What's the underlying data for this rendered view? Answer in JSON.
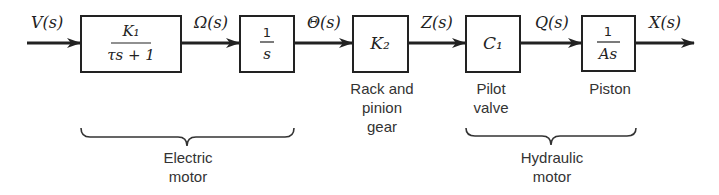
{
  "diagram": {
    "type": "block-diagram",
    "signals": [
      {
        "id": "input",
        "label": "V(s)"
      },
      {
        "id": "omega",
        "label": "Ω(s)"
      },
      {
        "id": "theta",
        "label": "Θ(s)"
      },
      {
        "id": "z",
        "label": "Z(s)"
      },
      {
        "id": "q",
        "label": "Q(s)"
      },
      {
        "id": "output",
        "label": "X(s)"
      }
    ],
    "blocks": [
      {
        "id": "motor-tf",
        "numerator": "K₁",
        "denominator": "τs + 1",
        "caption": []
      },
      {
        "id": "integrator",
        "numerator": "1",
        "denominator": "s",
        "caption": []
      },
      {
        "id": "rack-pinion",
        "gain": "K₂",
        "caption": [
          "Rack and",
          "pinion",
          "gear"
        ]
      },
      {
        "id": "pilot-valve",
        "gain": "C₁",
        "caption": [
          "Pilot",
          "valve"
        ]
      },
      {
        "id": "piston",
        "numerator": "1",
        "denominator": "As",
        "caption": [
          "Piston"
        ]
      }
    ],
    "groups": [
      {
        "id": "electric-motor",
        "label": [
          "Electric",
          "motor"
        ]
      },
      {
        "id": "hydraulic-motor",
        "label": [
          "Hydraulic",
          "motor"
        ]
      }
    ]
  }
}
